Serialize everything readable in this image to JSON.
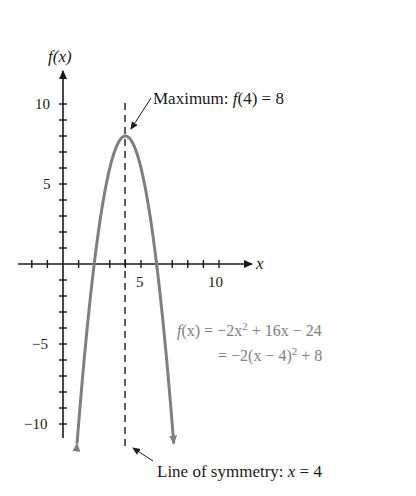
{
  "chart_data": {
    "type": "line",
    "title": "",
    "function": "f(x) = -2x^2 + 16x - 24",
    "xlabel": "x",
    "ylabel": "f(x)",
    "xlim": [
      -2,
      12
    ],
    "ylim": [
      -11.5,
      12
    ],
    "x_ticks_major": [
      5,
      10
    ],
    "y_ticks_major": [
      10,
      5,
      -5,
      -10
    ],
    "x_tick_step": 1,
    "y_tick_step": 1,
    "grid": false,
    "series": [
      {
        "name": "f(x) = -2x^2 + 16x - 24",
        "color": "#7f7f7f",
        "x": [
          0.9,
          1,
          1.5,
          2,
          2.5,
          3,
          3.5,
          4,
          4.5,
          5,
          5.5,
          6,
          6.5,
          7,
          7.1
        ],
        "y": [
          -11.22,
          -10,
          -4.5,
          0,
          3.5,
          6,
          7.5,
          8,
          7.5,
          6,
          3.5,
          0,
          -4.5,
          -10,
          -11.22
        ]
      }
    ],
    "vertex": {
      "x": 4,
      "y": 8
    },
    "axis_of_symmetry": 4,
    "annotations": [
      {
        "text": "Maximum: f(4) = 8",
        "points_to": [
          4,
          8
        ]
      },
      {
        "text": "Line of symmetry: x = 4",
        "points_to": [
          4,
          -11.5
        ]
      },
      {
        "text": "f(x) = −2x² + 16x − 24"
      },
      {
        "text": "= −2(x − 4)² + 8"
      }
    ]
  },
  "labels": {
    "y_axis": "f(x)",
    "x_axis": "x",
    "x_tick_5": "5",
    "x_tick_10": "10",
    "y_tick_10": "10",
    "y_tick_5": "5",
    "y_tick_m5": "−5",
    "y_tick_m10": "−10",
    "max_label_prefix": "Maximum: ",
    "max_label_func": "f",
    "max_label_rest": "(4) = 8",
    "sym_label_prefix": "Line of symmetry: ",
    "sym_label_var": "x",
    "sym_label_rest": " = 4",
    "eq1_lhs_f": "f",
    "eq1_lhs_rest": "(x) = −2x",
    "eq1_sup": "2",
    "eq1_tail": " + 16x − 24",
    "eq2_head": "= −2(x − 4)",
    "eq2_sup": "2",
    "eq2_tail": " + 8"
  },
  "colors": {
    "axis": "#1a1a1a",
    "curve": "#7f7f7f",
    "equation_text": "#808080",
    "label_text": "#1a1a1a"
  }
}
